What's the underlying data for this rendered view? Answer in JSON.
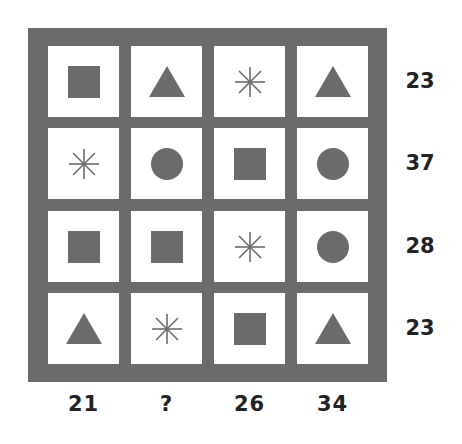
{
  "puzzle": {
    "frame_color": "#6b6b6b",
    "shape_color": "#6b6b6b",
    "grid": [
      [
        "square",
        "triangle",
        "asterisk",
        "triangle"
      ],
      [
        "asterisk",
        "circle",
        "square",
        "circle"
      ],
      [
        "square",
        "square",
        "asterisk",
        "circle"
      ],
      [
        "triangle",
        "asterisk",
        "square",
        "triangle"
      ]
    ],
    "row_sums": [
      "23",
      "37",
      "28",
      "23"
    ],
    "col_sums": [
      "21",
      "?",
      "26",
      "34"
    ]
  }
}
